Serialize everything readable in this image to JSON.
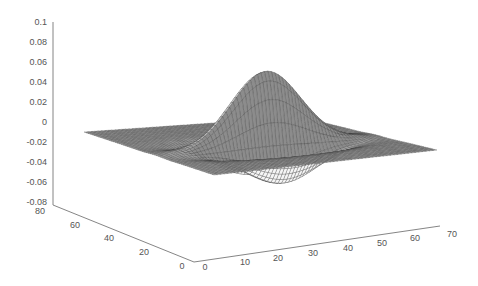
{
  "chart_data": {
    "type": "surface3d",
    "title": "",
    "xlabel": "",
    "ylabel": "",
    "zlabel": "",
    "x_ticks": [
      0,
      10,
      20,
      30,
      40,
      50,
      60,
      70
    ],
    "y_ticks": [
      0,
      20,
      40,
      60,
      80
    ],
    "z_ticks": [
      0.1,
      0.08,
      0.06,
      0.04,
      0.02,
      0,
      -0.02,
      -0.04,
      -0.06,
      -0.08
    ],
    "x_tick_labels": [
      "0",
      "10",
      "20",
      "30",
      "40",
      "50",
      "60",
      "70"
    ],
    "y_tick_labels": [
      "0",
      "20",
      "40",
      "60",
      "80"
    ],
    "z_tick_labels": [
      "0.1",
      "0.08",
      "0.06",
      "0.04",
      "0.02",
      "0",
      "-0.02",
      "-0.04",
      "-0.06",
      "-0.08"
    ],
    "xlim": [
      0,
      70
    ],
    "ylim": [
      0,
      80
    ],
    "zlim": [
      -0.08,
      0.1
    ],
    "grid": false,
    "surface": {
      "description": "Mesh of an oscillating wavelet-like bump centered on a flat zero plane; central positive peak with two negative lobes on either side",
      "grid_size": [
        64,
        64
      ],
      "peak": {
        "x": 32,
        "y": 40,
        "z": 0.073
      },
      "troughs": [
        {
          "x": 22,
          "y": 40,
          "z": -0.055
        },
        {
          "x": 42,
          "y": 40,
          "z": -0.05
        }
      ],
      "baseline_z": 0,
      "colors": {
        "mesh_edge": "#333333",
        "face_light": "#f0f0f0",
        "face_dark": "#8a8a8a"
      }
    }
  }
}
